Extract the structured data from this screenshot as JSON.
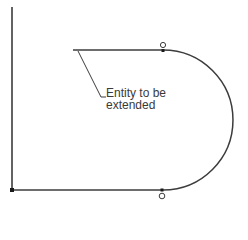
{
  "diagram": {
    "annotation": {
      "line1": "Entity to be",
      "line2": "extended"
    },
    "colors": {
      "stroke": "#3c3c3c",
      "text": "#3a3a3a",
      "background": "#ffffff"
    }
  }
}
